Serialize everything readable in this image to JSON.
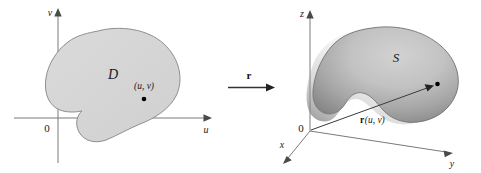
{
  "figure": {
    "background_color": "#ffffff"
  },
  "left_panel": {
    "name": "uv-parameter-plane",
    "axes": {
      "vertical_label": "v",
      "horizontal_label": "u",
      "origin_label": "0"
    },
    "region": {
      "label": "D",
      "fill_color": "#d6d6d6",
      "outline_color": "#8e8e8e"
    },
    "point": {
      "label": "(u, v)"
    }
  },
  "map_arrow": {
    "name": "mapping-arrow",
    "label": "r"
  },
  "right_panel": {
    "name": "xyz-space",
    "axes": {
      "z_label": "z",
      "x_label": "x",
      "y_label": "y",
      "origin_label": "0"
    },
    "surface": {
      "label": "S",
      "fill_light": "#c8c8c8",
      "fill_dark": "#8a8a8a",
      "outline_color": "#6e6e6e"
    },
    "vector": {
      "label": "r(u, v)",
      "label_bold_part": "r",
      "label_arg_part": "(u, v)"
    }
  },
  "colors": {
    "ink": "#1a1a1a",
    "axis": "#7a7a7a",
    "region_fill": "#d6d6d6",
    "surface_light": "#c8c8c8",
    "surface_dark": "#8a8a8a"
  }
}
